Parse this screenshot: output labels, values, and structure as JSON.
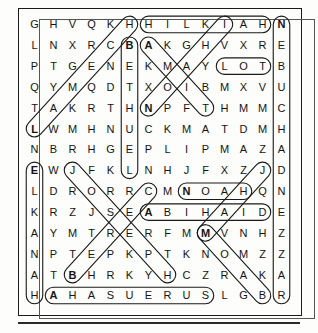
{
  "puzzle": {
    "type": "word-search",
    "rows": 14,
    "cols": 14,
    "grid": [
      [
        "G",
        "H",
        "V",
        "Q",
        "K",
        "H",
        "H",
        "I",
        "L",
        "K",
        "I",
        "A",
        "H",
        "N"
      ],
      [
        "L",
        "N",
        "X",
        "R",
        "C",
        "B",
        "A",
        "K",
        "G",
        "H",
        "V",
        "X",
        "R",
        "E"
      ],
      [
        "P",
        "T",
        "G",
        "E",
        "N",
        "E",
        "K",
        "M",
        "A",
        "Y",
        "L",
        "O",
        "T",
        "B"
      ],
      [
        "Q",
        "Y",
        "M",
        "Q",
        "D",
        "T",
        "X",
        "O",
        "I",
        "B",
        "M",
        "X",
        "V",
        "U"
      ],
      [
        "T",
        "A",
        "K",
        "R",
        "T",
        "H",
        "N",
        "P",
        "F",
        "T",
        "H",
        "M",
        "M",
        "C"
      ],
      [
        "L",
        "W",
        "M",
        "H",
        "N",
        "U",
        "C",
        "K",
        "M",
        "A",
        "T",
        "D",
        "M",
        "H"
      ],
      [
        "N",
        "B",
        "R",
        "H",
        "G",
        "E",
        "P",
        "L",
        "I",
        "P",
        "M",
        "A",
        "Z",
        "A"
      ],
      [
        "E",
        "W",
        "J",
        "F",
        "K",
        "L",
        "N",
        "H",
        "J",
        "F",
        "X",
        "Z",
        "J",
        "D"
      ],
      [
        "L",
        "D",
        "R",
        "O",
        "R",
        "R",
        "C",
        "M",
        "N",
        "O",
        "A",
        "H",
        "Q",
        "N"
      ],
      [
        "K",
        "R",
        "Z",
        "J",
        "S",
        "E",
        "A",
        "B",
        "I",
        "H",
        "A",
        "I",
        "D",
        "E"
      ],
      [
        "A",
        "Y",
        "M",
        "T",
        "R",
        "E",
        "R",
        "F",
        "M",
        "M",
        "V",
        "N",
        "H",
        "Z"
      ],
      [
        "N",
        "P",
        "T",
        "E",
        "P",
        "K",
        "P",
        "T",
        "K",
        "N",
        "O",
        "M",
        "Z",
        "Z"
      ],
      [
        "A",
        "T",
        "B",
        "H",
        "R",
        "K",
        "Y",
        "H",
        "C",
        "Z",
        "R",
        "A",
        "K",
        "A"
      ],
      [
        "H",
        "A",
        "H",
        "A",
        "S",
        "U",
        "E",
        "R",
        "U",
        "S",
        "L",
        "G",
        "B",
        "R"
      ]
    ],
    "found_words": [
      {
        "word": "HILKIAH",
        "start": [
          0,
          6
        ],
        "end": [
          0,
          12
        ],
        "orientation": "horizontal"
      },
      {
        "word": "LOT",
        "start": [
          2,
          10
        ],
        "end": [
          2,
          12
        ],
        "orientation": "horizontal"
      },
      {
        "word": "NOAH",
        "start": [
          8,
          8
        ],
        "end": [
          8,
          11
        ],
        "orientation": "horizontal"
      },
      {
        "word": "ABIHAIL",
        "start": [
          9,
          6
        ],
        "end": [
          9,
          12
        ],
        "orientation": "horizontal"
      },
      {
        "word": "AHASUERUS",
        "start": [
          13,
          1
        ],
        "end": [
          13,
          9
        ],
        "orientation": "horizontal"
      },
      {
        "word": "NEBUCHADNEZZAR",
        "start": [
          0,
          13
        ],
        "end": [
          13,
          13
        ],
        "orientation": "vertical"
      },
      {
        "word": "BETHUEL",
        "start": [
          1,
          5
        ],
        "end": [
          7,
          5
        ],
        "orientation": "vertical"
      },
      {
        "word": "ELKANAH",
        "start": [
          7,
          0
        ],
        "end": [
          13,
          0
        ],
        "orientation": "vertical"
      },
      {
        "word": "LAMECH",
        "start": [
          5,
          0
        ],
        "end": [
          0,
          5
        ],
        "orientation": "diagonal-up-right"
      },
      {
        "word": "AMON",
        "start": [
          1,
          6
        ],
        "end": [
          4,
          9
        ],
        "orientation": "diagonal-down-right"
      },
      {
        "word": "NAHOR",
        "start": [
          4,
          6
        ],
        "end": [
          0,
          10
        ],
        "orientation": "diagonal-up-right"
      },
      {
        "word": "JOSEPH",
        "start": [
          7,
          2
        ],
        "end": [
          12,
          7
        ],
        "orientation": "diagonal-down-right"
      },
      {
        "word": "BEREZER",
        "start": [
          12,
          2
        ],
        "end": [
          8,
          6
        ],
        "orientation": "diagonal-up-right"
      },
      {
        "word": "MOAB",
        "start": [
          10,
          9
        ],
        "end": [
          13,
          12
        ],
        "orientation": "diagonal-down-right"
      },
      {
        "word": "JAIR",
        "start": [
          7,
          12
        ],
        "end": [
          10,
          9
        ],
        "orientation": "diagonal-down-left"
      }
    ],
    "bold_letters": [
      [
        0,
        13
      ],
      [
        1,
        5
      ],
      [
        1,
        6
      ],
      [
        4,
        6
      ],
      [
        5,
        0
      ],
      [
        7,
        0
      ],
      [
        9,
        6
      ],
      [
        8,
        8
      ],
      [
        10,
        9
      ],
      [
        12,
        2
      ],
      [
        13,
        1
      ]
    ]
  },
  "style": {
    "letter_color": "#141414",
    "highlight_color": "#1a1a1a",
    "border_color": "#1a1a1a",
    "page_background": "#fdfdfb"
  }
}
